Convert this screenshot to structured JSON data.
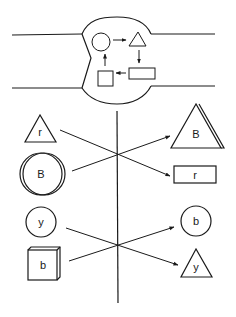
{
  "diagram": {
    "type": "schematic",
    "top_panel": {
      "description": "Channel with bulging chamber containing a cycle of shapes",
      "cycle": [
        "circle",
        "triangle",
        "rectangle",
        "square"
      ]
    },
    "mapping_1": {
      "left": [
        {
          "shape": "triangle",
          "label": "r"
        },
        {
          "shape": "circle-3d",
          "label": "B"
        }
      ],
      "right": [
        {
          "shape": "triangle-3d",
          "label": "B"
        },
        {
          "shape": "rectangle",
          "label": "r"
        }
      ]
    },
    "mapping_2": {
      "left": [
        {
          "shape": "circle",
          "label": "y"
        },
        {
          "shape": "cube",
          "label": "b"
        }
      ],
      "right": [
        {
          "shape": "circle",
          "label": "b"
        },
        {
          "shape": "triangle",
          "label": "y"
        }
      ]
    }
  },
  "labels": {
    "l1": "r",
    "l2": "B",
    "r1": "B",
    "r2": "r",
    "l3": "y",
    "l4": "b",
    "r3": "b",
    "r4": "y"
  },
  "colors": {
    "line": "#1a1a1a",
    "background": "#ffffff"
  }
}
